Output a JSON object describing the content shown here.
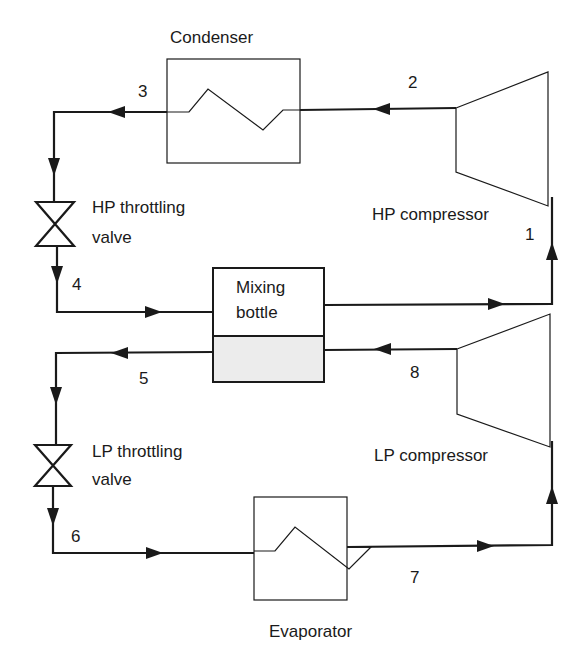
{
  "diagram": {
    "components": {
      "condenser": "Condenser",
      "hp_compressor": "HP compressor",
      "hp_valve_line1": "HP throttling",
      "hp_valve_line2": "valve",
      "mixing_bottle_line1": "Mixing",
      "mixing_bottle_line2": "bottle",
      "lp_compressor": "LP compressor",
      "lp_valve_line1": "LP throttling",
      "lp_valve_line2": "valve",
      "evaporator": "Evaporator"
    },
    "state_points": {
      "p1": "1",
      "p2": "2",
      "p3": "3",
      "p4": "4",
      "p5": "5",
      "p6": "6",
      "p7": "7",
      "p8": "8"
    },
    "colors": {
      "line": "#1a1a1a",
      "liquid_fill": "#ececec"
    }
  }
}
